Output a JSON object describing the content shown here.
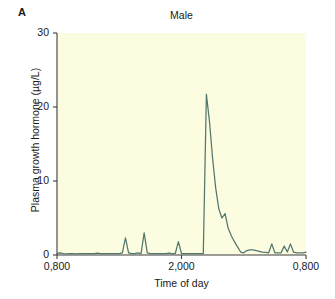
{
  "figure": {
    "panel_label": "A",
    "title": "Male"
  },
  "axes": {
    "x_title": "Time of day",
    "y_title": "Plasma growth hormone (µg/L)"
  },
  "chart_data": {
    "type": "line",
    "title": "Male",
    "xlabel": "Time of day",
    "ylabel": "Plasma growth hormone (µg/L)",
    "panel": "A",
    "grid": false,
    "legend": null,
    "line_color": "#53766e",
    "plot_background": "#fcfce1",
    "xlim": [
      0,
      24
    ],
    "ylim": [
      0,
      30
    ],
    "ytick_values": [
      0,
      10,
      20,
      30
    ],
    "ytick_labels": [
      "0",
      "10",
      "20",
      "30"
    ],
    "xtick_values": [
      0,
      12,
      24
    ],
    "xtick_labels": [
      "0,800",
      "2,000",
      "0,800"
    ],
    "x_units": "hours elapsed from 08:00",
    "series": [
      {
        "name": "Plasma growth hormone",
        "x": [
          0.0,
          0.3,
          0.6,
          0.9,
          1.2,
          1.5,
          1.8,
          2.1,
          2.4,
          2.7,
          3.0,
          3.3,
          3.6,
          3.9,
          4.2,
          4.5,
          4.8,
          5.1,
          5.4,
          5.7,
          6.0,
          6.3,
          6.6,
          6.9,
          7.2,
          7.5,
          7.8,
          8.1,
          8.4,
          8.7,
          9.0,
          9.3,
          9.6,
          9.9,
          10.2,
          10.5,
          10.8,
          11.1,
          11.4,
          11.7,
          12.0,
          12.3,
          12.6,
          12.9,
          13.2,
          13.5,
          13.8,
          14.1,
          14.4,
          14.7,
          15.0,
          15.3,
          15.6,
          15.9,
          16.2,
          16.5,
          16.8,
          17.1,
          17.4,
          17.7,
          18.0,
          18.3,
          18.6,
          18.9,
          19.2,
          19.5,
          19.8,
          20.1,
          20.4,
          20.7,
          21.0,
          21.3,
          21.6,
          21.9,
          22.2,
          22.5,
          22.8,
          23.1,
          23.4,
          23.7,
          24.0
        ],
        "y": [
          0.2,
          0.3,
          0.2,
          0.15,
          0.2,
          0.2,
          0.15,
          0.2,
          0.2,
          0.2,
          0.2,
          0.2,
          0.2,
          0.25,
          0.2,
          0.2,
          0.2,
          0.2,
          0.2,
          0.2,
          0.2,
          0.3,
          2.3,
          0.3,
          0.2,
          0.2,
          0.3,
          0.2,
          3.0,
          0.3,
          0.2,
          0.2,
          0.2,
          0.2,
          0.2,
          0.2,
          0.25,
          0.2,
          0.2,
          1.8,
          0.2,
          0.2,
          0.2,
          0.2,
          0.2,
          0.2,
          0.2,
          0.2,
          21.7,
          18.0,
          13.0,
          9.0,
          6.2,
          5.0,
          5.6,
          3.6,
          2.6,
          1.8,
          1.1,
          0.4,
          0.3,
          0.6,
          0.7,
          0.7,
          0.6,
          0.5,
          0.4,
          0.35,
          0.3,
          1.5,
          0.3,
          0.3,
          0.3,
          1.2,
          0.4,
          1.5,
          0.4,
          0.3,
          0.3,
          0.3,
          0.4
        ]
      }
    ],
    "annotations": [
      {
        "text": "main nocturnal surge",
        "x": 14.4,
        "y": 21.7
      }
    ]
  }
}
